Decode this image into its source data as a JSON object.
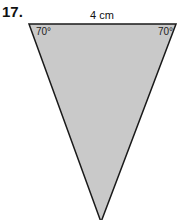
{
  "problem_number": "17.",
  "figure": {
    "shape": "triangle",
    "top_side_label": "4 cm",
    "angles": {
      "top_left": "70°",
      "top_right": "70°"
    },
    "fill_color": "#c9c9c9",
    "stroke_color": "#1a1a1a"
  }
}
